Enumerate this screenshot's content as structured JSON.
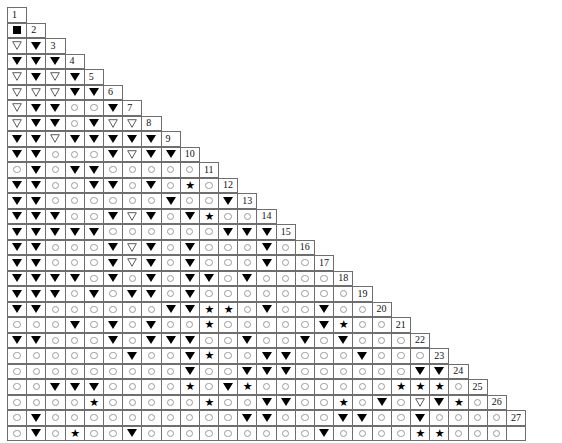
{
  "chart_data": {
    "type": "table",
    "rows_count": 27,
    "columns_count": 27,
    "legend": {
      "square": "filled-square",
      "tri_filled": "filled-down-triangle",
      "tri_open": "open-down-triangle",
      "circle": "open-circle",
      "star": "black-star",
      "blank": "empty-cell"
    },
    "row_numbers": [
      1,
      2,
      3,
      4,
      5,
      6,
      7,
      8,
      9,
      10,
      11,
      12,
      13,
      14,
      15,
      16,
      17,
      18,
      19,
      20,
      21,
      22,
      23,
      24,
      25,
      26,
      27
    ],
    "symbol_colors": {
      "black": "#000000",
      "circle_gray": "#9a9a9a",
      "grid_line": "#6e6e6e",
      "background": "#ffffff",
      "number_text": "#111111"
    },
    "grid": [
      [],
      [
        "square"
      ],
      [
        "tri_open",
        "tri_filled"
      ],
      [
        "tri_filled",
        "tri_filled",
        "tri_filled"
      ],
      [
        "tri_open",
        "tri_filled",
        "tri_open",
        "tri_filled"
      ],
      [
        "tri_open",
        "tri_open",
        "tri_open",
        "tri_filled",
        "tri_filled"
      ],
      [
        "tri_open",
        "tri_filled",
        "tri_filled",
        "circle",
        "circle",
        "tri_filled"
      ],
      [
        "tri_open",
        "tri_filled",
        "tri_filled",
        "circle",
        "tri_filled",
        "tri_open",
        "tri_open"
      ],
      [
        "tri_filled",
        "tri_filled",
        "tri_open",
        "tri_filled",
        "tri_filled",
        "tri_filled",
        "tri_filled",
        "tri_filled"
      ],
      [
        "tri_filled",
        "tri_filled",
        "circle",
        "circle",
        "circle",
        "tri_filled",
        "tri_open",
        "tri_filled",
        "tri_filled"
      ],
      [
        "circle",
        "tri_filled",
        "circle",
        "tri_filled",
        "tri_filled",
        "circle",
        "circle",
        "circle",
        "circle",
        "circle"
      ],
      [
        "tri_filled",
        "tri_filled",
        "circle",
        "circle",
        "tri_filled",
        "tri_filled",
        "circle",
        "tri_filled",
        "circle",
        "star",
        "circle"
      ],
      [
        "tri_filled",
        "tri_filled",
        "circle",
        "circle",
        "circle",
        "circle",
        "circle",
        "circle",
        "tri_filled",
        "circle",
        "circle",
        "tri_filled"
      ],
      [
        "tri_filled",
        "tri_filled",
        "tri_filled",
        "circle",
        "circle",
        "tri_filled",
        "tri_open",
        "tri_filled",
        "circle",
        "tri_filled",
        "star",
        "circle",
        "circle"
      ],
      [
        "tri_filled",
        "tri_filled",
        "tri_filled",
        "tri_filled",
        "tri_filled",
        "circle",
        "circle",
        "circle",
        "circle",
        "circle",
        "circle",
        "tri_filled",
        "tri_filled",
        "tri_filled"
      ],
      [
        "tri_filled",
        "tri_filled",
        "circle",
        "circle",
        "circle",
        "tri_filled",
        "tri_open",
        "tri_filled",
        "circle",
        "tri_filled",
        "circle",
        "circle",
        "circle",
        "tri_filled",
        "circle"
      ],
      [
        "tri_filled",
        "tri_filled",
        "circle",
        "circle",
        "circle",
        "tri_filled",
        "tri_open",
        "tri_filled",
        "circle",
        "tri_filled",
        "circle",
        "circle",
        "circle",
        "tri_filled",
        "circle",
        "circle"
      ],
      [
        "tri_filled",
        "tri_filled",
        "tri_filled",
        "tri_filled",
        "circle",
        "tri_filled",
        "circle",
        "tri_filled",
        "circle",
        "tri_filled",
        "tri_filled",
        "circle",
        "tri_filled",
        "circle",
        "circle",
        "circle",
        "circle"
      ],
      [
        "tri_filled",
        "tri_filled",
        "tri_filled",
        "circle",
        "tri_filled",
        "circle",
        "tri_filled",
        "tri_filled",
        "circle",
        "tri_filled",
        "circle",
        "circle",
        "circle",
        "circle",
        "circle",
        "circle",
        "circle",
        "circle"
      ],
      [
        "tri_filled",
        "tri_filled",
        "circle",
        "circle",
        "circle",
        "circle",
        "circle",
        "circle",
        "tri_filled",
        "tri_filled",
        "star",
        "star",
        "circle",
        "tri_filled",
        "circle",
        "circle",
        "tri_filled",
        "circle",
        "circle"
      ],
      [
        "circle",
        "circle",
        "circle",
        "tri_filled",
        "circle",
        "tri_filled",
        "circle",
        "tri_filled",
        "circle",
        "circle",
        "star",
        "circle",
        "circle",
        "circle",
        "circle",
        "circle",
        "tri_filled",
        "star",
        "circle",
        "circle"
      ],
      [
        "tri_filled",
        "tri_filled",
        "circle",
        "circle",
        "circle",
        "tri_filled",
        "circle",
        "tri_filled",
        "tri_filled",
        "tri_filled",
        "circle",
        "circle",
        "tri_filled",
        "circle",
        "circle",
        "tri_filled",
        "circle",
        "tri_filled",
        "circle",
        "circle",
        "circle"
      ],
      [
        "circle",
        "circle",
        "circle",
        "circle",
        "circle",
        "circle",
        "tri_filled",
        "circle",
        "circle",
        "tri_filled",
        "star",
        "circle",
        "circle",
        "tri_filled",
        "tri_filled",
        "circle",
        "circle",
        "circle",
        "tri_filled",
        "circle",
        "circle",
        "circle"
      ],
      [
        "circle",
        "circle",
        "circle",
        "circle",
        "circle",
        "circle",
        "circle",
        "circle",
        "circle",
        "tri_filled",
        "circle",
        "circle",
        "tri_filled",
        "tri_filled",
        "tri_filled",
        "circle",
        "circle",
        "circle",
        "circle",
        "circle",
        "circle",
        "tri_filled",
        "tri_filled"
      ],
      [
        "circle",
        "circle",
        "tri_filled",
        "tri_filled",
        "tri_filled",
        "circle",
        "circle",
        "circle",
        "circle",
        "star",
        "circle",
        "tri_filled",
        "star",
        "circle",
        "circle",
        "circle",
        "circle",
        "circle",
        "circle",
        "circle",
        "star",
        "star",
        "star",
        "circle"
      ],
      [
        "circle",
        "circle",
        "circle",
        "circle",
        "star",
        "circle",
        "circle",
        "circle",
        "circle",
        "circle",
        "star",
        "circle",
        "circle",
        "tri_filled",
        "tri_filled",
        "circle",
        "circle",
        "star",
        "circle",
        "tri_filled",
        "circle",
        "tri_open",
        "tri_filled",
        "star",
        "circle"
      ],
      [
        "circle",
        "tri_filled",
        "circle",
        "circle",
        "circle",
        "circle",
        "circle",
        "circle",
        "circle",
        "circle",
        "circle",
        "circle",
        "tri_filled",
        "tri_filled",
        "circle",
        "circle",
        "circle",
        "tri_filled",
        "tri_filled",
        "circle",
        "circle",
        "tri_filled",
        "circle",
        "circle",
        "circle",
        "circle"
      ],
      [
        "circle",
        "tri_filled",
        "circle",
        "star",
        "circle",
        "circle",
        "tri_filled",
        "circle",
        "circle",
        "circle",
        "circle",
        "circle",
        "circle",
        "circle",
        "circle",
        "circle",
        "tri_filled",
        "circle",
        "circle",
        "circle",
        "circle",
        "star",
        "star",
        "circle",
        "circle",
        "circle"
      ]
    ]
  }
}
